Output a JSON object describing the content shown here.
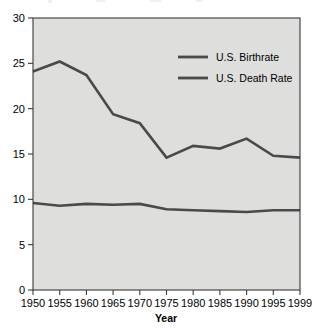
{
  "chart_data": {
    "type": "line",
    "title": "",
    "xlabel": "Year",
    "ylabel": "",
    "x": [
      1950,
      1955,
      1960,
      1965,
      1970,
      1975,
      1980,
      1985,
      1990,
      1995,
      1999
    ],
    "xticklabels": [
      "1950",
      "1955",
      "1960",
      "1965",
      "1970",
      "1975",
      "1980",
      "1985",
      "1990",
      "1995",
      "1999"
    ],
    "yticklabels": [
      "0",
      "5",
      "10",
      "15",
      "20",
      "25",
      "30"
    ],
    "yticks": [
      0,
      5,
      10,
      15,
      20,
      25,
      30
    ],
    "xlim": [
      1950,
      1999
    ],
    "ylim": [
      0,
      30
    ],
    "grid": false,
    "legend_position": "upper-right-inside",
    "series": [
      {
        "name": "U.S. Birthrate",
        "color": "#4a4a4a",
        "values": [
          24.1,
          25.2,
          23.7,
          19.4,
          18.4,
          14.6,
          15.9,
          15.6,
          16.7,
          14.8,
          14.6
        ]
      },
      {
        "name": "U.S. Death Rate",
        "color": "#4a4a4a",
        "values": [
          9.6,
          9.3,
          9.5,
          9.4,
          9.5,
          8.9,
          8.8,
          8.7,
          8.6,
          8.8,
          8.8
        ]
      }
    ]
  },
  "legend": {
    "items": [
      {
        "label": "U.S. Birthrate"
      },
      {
        "label": "U.S. Death Rate"
      }
    ]
  },
  "axes": {
    "x_title": "Year"
  },
  "colors": {
    "plot_background": "#dededd",
    "frame": "#3a3a3a",
    "line": "#4a4a4a",
    "text": "#000000",
    "page_background": "#ffffff"
  }
}
